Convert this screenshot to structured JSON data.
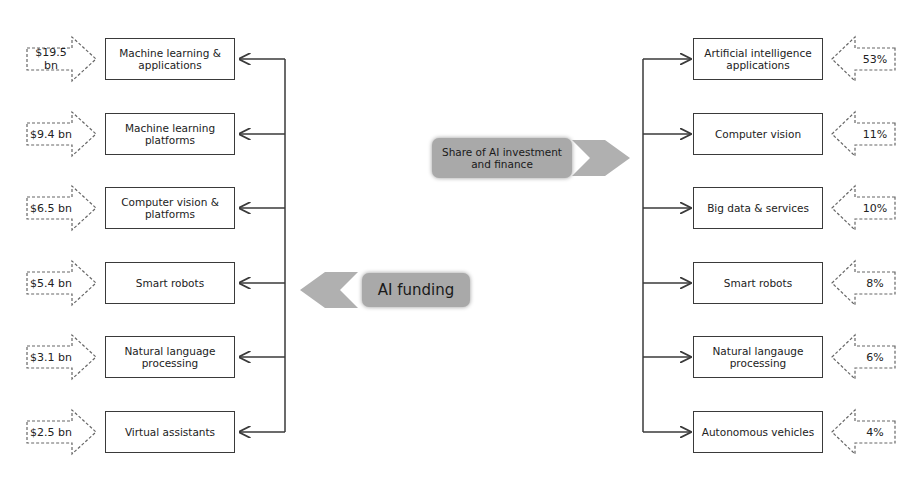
{
  "left": {
    "title": "AI funding",
    "items": [
      {
        "value": "$19.5 bn",
        "label": "Machine learning & applications"
      },
      {
        "value": "$9.4 bn",
        "label": "Machine learning platforms"
      },
      {
        "value": "$6.5 bn",
        "label": "Computer vision & platforms"
      },
      {
        "value": "$5.4 bn",
        "label": "Smart robots"
      },
      {
        "value": "$3.1 bn",
        "label": "Natural language processing"
      },
      {
        "value": "$2.5 bn",
        "label": "Virtual assistants"
      }
    ]
  },
  "right": {
    "title": "Share of AI investment and finance",
    "items": [
      {
        "value": "53%",
        "label": "Artificial intelligence applications"
      },
      {
        "value": "11%",
        "label": "Computer vision"
      },
      {
        "value": "10%",
        "label": "Big data & services"
      },
      {
        "value": "8%",
        "label": "Smart robots"
      },
      {
        "value": "6%",
        "label": "Natural langauge processing"
      },
      {
        "value": "4%",
        "label": "Autonomous vehicles"
      }
    ]
  },
  "colors": {
    "pill": "#a9a9a9",
    "line": "#3a3a3a",
    "dashed": "#666666"
  }
}
